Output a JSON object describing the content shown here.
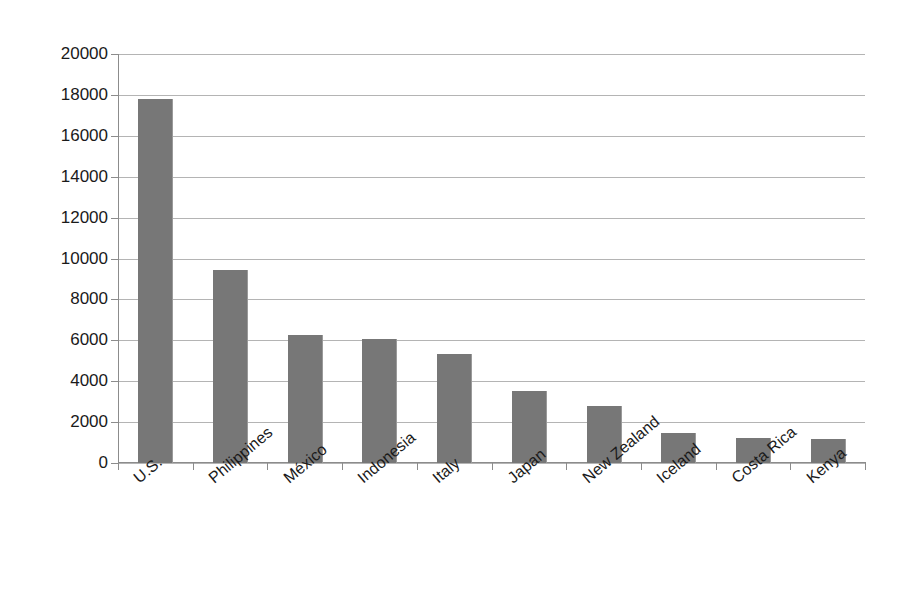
{
  "chart_data": {
    "type": "bar",
    "title": "",
    "subtitle": "",
    "xlabel": "",
    "ylabel": "",
    "categories": [
      "U.S.",
      "Philippines",
      "México",
      "Indonesia",
      "Italy",
      "Japan",
      "New Zealand",
      "Iceland",
      "Costa Rica",
      "Kenya"
    ],
    "values": [
      17800,
      9450,
      6280,
      6080,
      5350,
      3500,
      2780,
      1480,
      1230,
      1150
    ],
    "ylim": [
      0,
      20000
    ],
    "yticks": [
      0,
      2000,
      4000,
      6000,
      8000,
      10000,
      12000,
      14000,
      16000,
      18000,
      20000
    ],
    "ytick_labels": [
      "0",
      "2000",
      "4000",
      "6000",
      "8000",
      "10000",
      "12000",
      "14000",
      "16000",
      "18000",
      "20000"
    ],
    "grid": true,
    "grid_axis": "y",
    "legend": false,
    "legend_position": "none",
    "bar_color": "#777777",
    "grid_color": "#b4b4b4",
    "axis_color": "#8c8c8c",
    "background_color": "#ffffff",
    "xtick_label_rotation": -40
  }
}
